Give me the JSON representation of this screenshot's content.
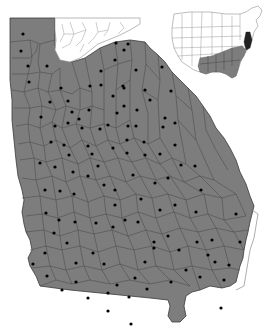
{
  "map": {
    "title": "",
    "region": "Georgia",
    "colors": {
      "occupied_fill": "#7d7d7d",
      "county_border": "#4a4a4a",
      "unoccupied_fill": "#ffffff",
      "dot": "#000000"
    },
    "legend": [],
    "inset": {
      "region": "United States",
      "shaded_region": "Southeastern states",
      "highlight": "Delmarva / Chesapeake area (dark)"
    },
    "dots": [
      [
        23,
        34
      ],
      [
        21,
        51
      ],
      [
        28,
        66
      ],
      [
        47,
        66
      ],
      [
        29,
        82
      ],
      [
        61,
        88
      ],
      [
        50,
        102
      ],
      [
        41,
        117
      ],
      [
        68,
        101
      ],
      [
        79,
        119
      ],
      [
        72,
        112
      ],
      [
        90,
        86
      ],
      [
        101,
        71
      ],
      [
        115,
        60
      ],
      [
        128,
        44
      ],
      [
        116,
        43
      ],
      [
        124,
        50
      ],
      [
        136,
        70
      ],
      [
        124,
        88
      ],
      [
        101,
        85
      ],
      [
        89,
        110
      ],
      [
        123,
        86
      ],
      [
        113,
        96
      ],
      [
        124,
        106
      ],
      [
        137,
        110
      ],
      [
        128,
        126
      ],
      [
        117,
        113
      ],
      [
        136,
        126
      ],
      [
        100,
        129
      ],
      [
        108,
        125
      ],
      [
        82,
        128
      ],
      [
        68,
        123
      ],
      [
        55,
        126
      ],
      [
        64,
        145
      ],
      [
        51,
        142
      ],
      [
        40,
        163
      ],
      [
        55,
        167
      ],
      [
        73,
        172
      ],
      [
        69,
        155
      ],
      [
        88,
        146
      ],
      [
        92,
        154
      ],
      [
        98,
        166
      ],
      [
        113,
        148
      ],
      [
        127,
        153
      ],
      [
        127,
        140
      ],
      [
        144,
        142
      ],
      [
        145,
        155
      ],
      [
        160,
        154
      ],
      [
        163,
        127
      ],
      [
        175,
        123
      ],
      [
        165,
        118
      ],
      [
        171,
        91
      ],
      [
        162,
        67
      ],
      [
        150,
        100
      ],
      [
        145,
        90
      ],
      [
        175,
        145
      ],
      [
        181,
        165
      ],
      [
        195,
        166
      ],
      [
        168,
        178
      ],
      [
        155,
        183
      ],
      [
        133,
        175
      ],
      [
        115,
        190
      ],
      [
        104,
        185
      ],
      [
        88,
        176
      ],
      [
        74,
        194
      ],
      [
        60,
        191
      ],
      [
        45,
        190
      ],
      [
        46,
        213
      ],
      [
        59,
        220
      ],
      [
        75,
        222
      ],
      [
        96,
        223
      ],
      [
        115,
        205
      ],
      [
        113,
        227
      ],
      [
        125,
        220
      ],
      [
        141,
        199
      ],
      [
        138,
        222
      ],
      [
        160,
        210
      ],
      [
        175,
        205
      ],
      [
        201,
        190
      ],
      [
        196,
        212
      ],
      [
        212,
        240
      ],
      [
        197,
        242
      ],
      [
        215,
        262
      ],
      [
        208,
        255
      ],
      [
        200,
        277
      ],
      [
        224,
        280
      ],
      [
        186,
        270
      ],
      [
        179,
        250
      ],
      [
        168,
        236
      ],
      [
        154,
        242
      ],
      [
        145,
        262
      ],
      [
        135,
        278
      ],
      [
        117,
        285
      ],
      [
        104,
        264
      ],
      [
        93,
        253
      ],
      [
        76,
        263
      ],
      [
        67,
        243
      ],
      [
        54,
        233
      ],
      [
        45,
        253
      ],
      [
        33,
        264
      ],
      [
        47,
        276
      ],
      [
        62,
        290
      ],
      [
        76,
        282
      ],
      [
        88,
        298
      ],
      [
        108,
        293
      ],
      [
        129,
        297
      ],
      [
        147,
        289
      ],
      [
        171,
        282
      ],
      [
        236,
        214
      ],
      [
        240,
        242
      ],
      [
        229,
        265
      ],
      [
        221,
        308
      ],
      [
        108,
        311
      ],
      [
        131,
        324
      ],
      [
        154,
        248
      ]
    ]
  }
}
